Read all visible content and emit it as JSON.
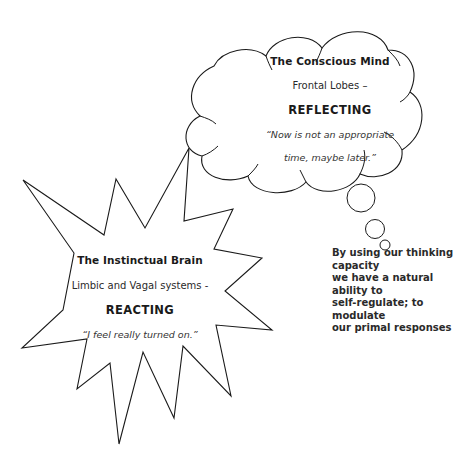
{
  "conscious_mind": {
    "title": "The Conscious Mind",
    "subtitle": "Frontal Lobes –",
    "state": "REFLECTING",
    "quote_line1": "“Now is not an appropriate",
    "quote_line2": "time, maybe later.”"
  },
  "instinctual_brain": {
    "title": "The Instinctual Brain",
    "subtitle": "Limbic and Vagal systems -",
    "state": "REACTING",
    "quote": "“I feel really turned on.”"
  },
  "caption": {
    "line1": "By using our thinking capacity",
    "line2": "we have a natural ability to",
    "line3": "self-regulate; to modulate",
    "line4": "our primal responses"
  },
  "shapes": {
    "thought_cloud": "cloud-shape",
    "thought_bubbles": [
      "bubble-large",
      "bubble-medium",
      "bubble-small"
    ],
    "starburst": "explosion-shape"
  },
  "colors": {
    "stroke": "#1a1a1a",
    "background": "#ffffff"
  }
}
